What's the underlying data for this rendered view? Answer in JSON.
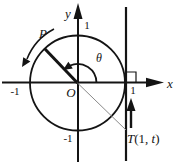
{
  "figure": {
    "labels": {
      "y_axis": "y",
      "x_axis": "x",
      "origin": "O",
      "point_p": "P",
      "angle": "θ",
      "one_top": "1",
      "one_right": "1",
      "minus_one_left": "-1",
      "minus_one_bottom": "-1",
      "t_name": "T",
      "t_open": "(1, ",
      "t_var": "t",
      "t_close": ")"
    },
    "colors": {
      "ink": "#141414",
      "secant_line": "#8a8a8a",
      "background": "#ffffff"
    }
  }
}
